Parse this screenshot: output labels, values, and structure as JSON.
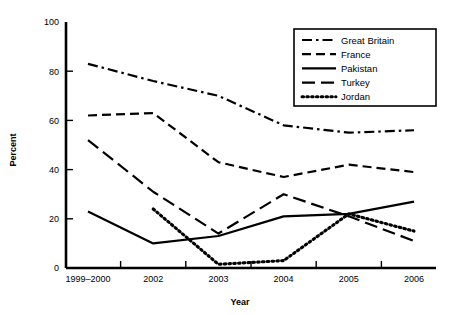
{
  "chart_data": {
    "type": "line",
    "title": "",
    "xlabel": "Year",
    "ylabel": "Percent",
    "categories": [
      "1999–2000",
      "2002",
      "2003",
      "2004",
      "2005",
      "2006"
    ],
    "ylim": [
      0,
      100
    ],
    "yticks": [
      0,
      20,
      40,
      60,
      80,
      100
    ],
    "ytick_labels": [
      "0",
      "20",
      "40",
      "60",
      "80",
      "100"
    ],
    "grid": false,
    "legend_position": "top-right",
    "series": [
      {
        "name": "Great Britain",
        "style": "dash-dot",
        "values": [
          83,
          76,
          70,
          58,
          55,
          56
        ]
      },
      {
        "name": "France",
        "style": "dashed",
        "values": [
          62,
          63,
          43,
          37,
          42,
          39
        ]
      },
      {
        "name": "Pakistan",
        "style": "solid",
        "values": [
          23,
          10,
          13,
          21,
          22,
          27
        ]
      },
      {
        "name": "Turkey",
        "style": "long-dash",
        "values": [
          52,
          31,
          14,
          30,
          21,
          11
        ]
      },
      {
        "name": "Jordan",
        "style": "dotted",
        "values": [
          null,
          24,
          1.5,
          3,
          22,
          15
        ]
      }
    ]
  },
  "axis": {
    "y_title": "Percent",
    "x_title": "Year"
  }
}
